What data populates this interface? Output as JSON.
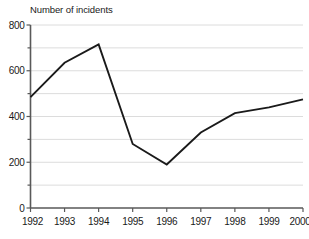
{
  "chart_data": {
    "type": "line",
    "title": "Number of incidents",
    "xlabel": "",
    "ylabel": "",
    "categories": [
      "1992",
      "1993",
      "1994",
      "1995",
      "1996",
      "1997",
      "1998",
      "1999",
      "2000"
    ],
    "x": [
      1992,
      1993,
      1994,
      1995,
      1996,
      1997,
      1998,
      1999,
      2000
    ],
    "values": [
      485,
      635,
      715,
      280,
      190,
      330,
      415,
      440,
      475
    ],
    "series": [
      {
        "name": "Number of incidents",
        "values": [
          485,
          635,
          715,
          280,
          190,
          330,
          415,
          440,
          475
        ]
      }
    ],
    "ylim": [
      0,
      800
    ],
    "xlim": [
      1992,
      2000
    ],
    "y_major_ticks": [
      0,
      200,
      400,
      600,
      800
    ],
    "y_major_tick_labels": [
      "0",
      "200",
      "400",
      "600",
      "800"
    ],
    "y_minor_ticks": [
      100,
      300,
      500,
      700
    ],
    "y_gridline_values": [
      100,
      200,
      300,
      400,
      500,
      600,
      700,
      800
    ],
    "x_tick_labels": [
      "1992",
      "1993",
      "1994",
      "1995",
      "1996",
      "1997",
      "1998",
      "1999",
      "2000"
    ],
    "grid": true,
    "grid_axis": "y",
    "legend": false,
    "legend_position": "none",
    "line_color": "#1a1a1a",
    "grid_color": "#dcdcdc",
    "axis_color": "#595959",
    "background_color": "#ffffff",
    "markers": false
  }
}
